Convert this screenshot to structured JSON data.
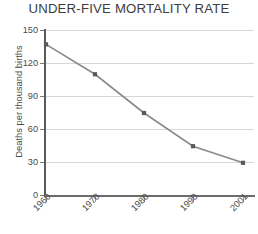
{
  "chart_data": {
    "type": "line",
    "title": "UNDER-FIVE MORTALITY RATE",
    "xlabel": "",
    "ylabel": "Deaths per thousand births",
    "categories": [
      "1960",
      "1970",
      "1980",
      "1990",
      "2001"
    ],
    "values": [
      137,
      110,
      75,
      45,
      30
    ],
    "series": [
      {
        "name": "Under-five mortality rate",
        "values": [
          137,
          110,
          75,
          45,
          30
        ]
      }
    ],
    "ylim": [
      0,
      150
    ],
    "yticks": [
      0,
      30,
      60,
      90,
      120,
      150
    ],
    "ytick_labels": [
      "0",
      "30",
      "60",
      "90",
      "120",
      "150"
    ],
    "xtick_labels": [
      "1960",
      "1970",
      "1980",
      "1990",
      "2001"
    ],
    "grid": true,
    "legend": "none",
    "marker": "square",
    "line_color": "#8a8a8a",
    "marker_color": "#585858",
    "grid_color": "#d7d7d7",
    "axis_color": "#5a5a5a",
    "background": "#ffffff"
  }
}
